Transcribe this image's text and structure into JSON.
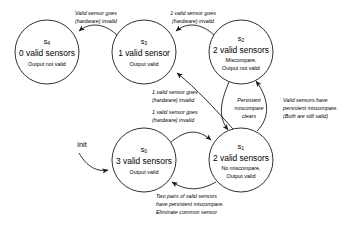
{
  "diagram": {
    "background_color": "#ffffff",
    "stroke_color": "#1a1a1a",
    "init_label": "init",
    "states": [
      {
        "id": "s4",
        "id_base": "s",
        "id_sub": "4",
        "title": "0 valid sensors",
        "detail_lines": [
          "Output not valid"
        ],
        "cx": 47,
        "cy": 52,
        "r": 32
      },
      {
        "id": "s3",
        "id_base": "s",
        "id_sub": "3",
        "title": "1 valid sensor",
        "detail_lines": [
          "Output valid"
        ],
        "cx": 144,
        "cy": 52,
        "r": 32
      },
      {
        "id": "s2",
        "id_base": "s",
        "id_sub": "2",
        "title": "2 valid sensors",
        "detail_lines": [
          "Miscompare,",
          "Output not valid"
        ],
        "cx": 241,
        "cy": 52,
        "r": 32
      },
      {
        "id": "s0",
        "id_base": "s",
        "id_sub": "0",
        "title": "3 valid sensors",
        "detail_lines": [
          "Output valid"
        ],
        "cx": 144,
        "cy": 160,
        "r": 32
      },
      {
        "id": "s1",
        "id_base": "s",
        "id_sub": "1",
        "title": "2 valid sensors",
        "detail_lines": [
          "No miscompare,",
          "Output valid"
        ],
        "cx": 241,
        "cy": 160,
        "r": 32
      }
    ],
    "transitions": [
      {
        "name": "s3-to-s4",
        "from": "s3",
        "to": "s4",
        "lines": [
          "Valid sensor goes",
          "(hardware) invalid"
        ],
        "label_x": 96,
        "label_y": 15
      },
      {
        "name": "s2-to-s3",
        "from": "s2",
        "to": "s3",
        "lines": [
          "1 valid sensor goes",
          "(hardware) invalid"
        ],
        "label_x": 193,
        "label_y": 15
      },
      {
        "name": "s1-to-s3",
        "from": "s1",
        "to": "s3",
        "lines": [
          "1 valid sensor goes",
          "(hardware) invalid"
        ],
        "label_x": 158,
        "label_y": 95
      },
      {
        "name": "s0-to-s1",
        "from": "s0",
        "to": "s1",
        "lines": [
          "1 valid sensor goes",
          "(hardware) invalid"
        ],
        "label_x": 158,
        "label_y": 115
      },
      {
        "name": "s2-to-s1",
        "from": "s2",
        "to": "s1",
        "lines": [
          "Persistent",
          "miscompare",
          "clears"
        ],
        "label_x": 248,
        "label_y": 103
      },
      {
        "name": "s1-to-s2",
        "from": "s1",
        "to": "s2",
        "lines": [
          "Valid sensors have",
          "persistent miscompare.",
          "(Both are still valid)"
        ],
        "label_x": 288,
        "label_y": 103
      },
      {
        "name": "s1-to-s0",
        "from": "s1",
        "to": "s0",
        "lines": [
          "Two pairs of valid sensors",
          "have persistent miscompare.",
          "Eliminate common sensor."
        ],
        "label_x": 163,
        "label_y": 198
      }
    ]
  }
}
